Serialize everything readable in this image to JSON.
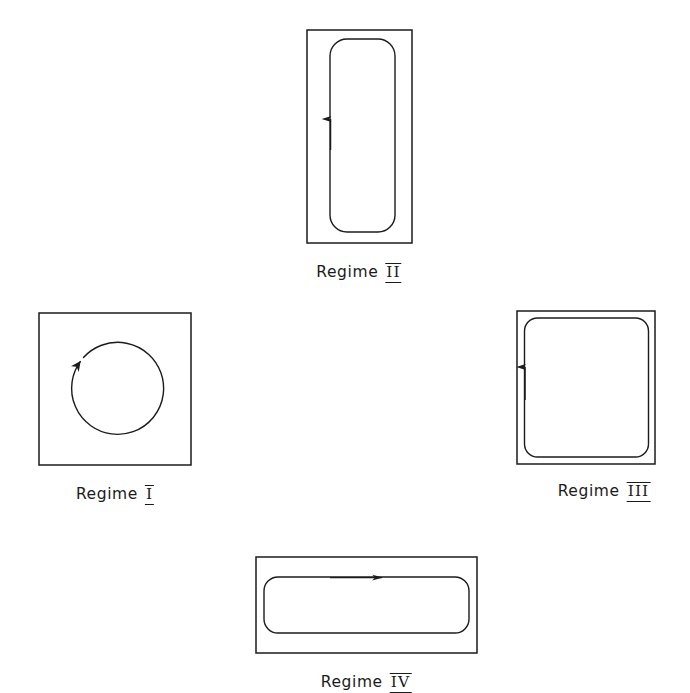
{
  "figure": {
    "background_color": "#ffffff",
    "stroke_color": "#1b1b1b",
    "width": 690,
    "height": 690
  },
  "panels": [
    {
      "id": "regime-1",
      "label_word": "Regime",
      "label_numeral": "I",
      "label_text": "Regime I",
      "shape": "square-with-circle",
      "flow_direction": "clockwise",
      "label_x": 115,
      "label_y": 487
    },
    {
      "id": "regime-2",
      "label_word": "Regime",
      "label_numeral": "II",
      "label_text": "Regime II",
      "shape": "tall-rectangle-with-rounded-loop",
      "flow_direction": "upward-on-left",
      "label_x": 359,
      "label_y": 265
    },
    {
      "id": "regime-3",
      "label_word": "Regime",
      "label_numeral": "III",
      "label_text": "Regime III",
      "shape": "square-with-rounded-loop",
      "flow_direction": "upward-on-left",
      "label_x": 604,
      "label_y": 484
    },
    {
      "id": "regime-4",
      "label_word": "Regime",
      "label_numeral": "IV",
      "label_text": "Regime IV",
      "shape": "wide-rectangle-with-rounded-loop",
      "flow_direction": "rightward-on-top",
      "label_x": 366,
      "label_y": 675
    }
  ]
}
